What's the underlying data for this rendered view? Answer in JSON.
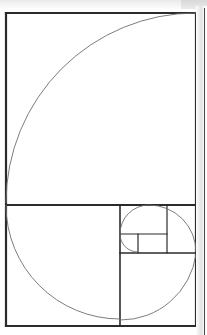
{
  "figure": {
    "background_color": "#ffffff",
    "line_color": "#2b2b2b",
    "spiral_color": "#6e6e6e",
    "page_edge_color": "#e2e2e2",
    "frame": {
      "x": 6,
      "y": 13,
      "width": 190,
      "height": 313
    },
    "stroke_widths": {
      "frame": 2.2,
      "divider": 2.0,
      "inner": 1.6,
      "small": 1.2,
      "spiral": 0.9
    }
  },
  "chart_data": {
    "type": "diagram",
    "ratio": 1.618,
    "aspect": "190 x 313 px outer rectangle",
    "squares": [
      {
        "index": 1,
        "fib": 8,
        "x": 6,
        "y": 13,
        "size": 190,
        "arc_center": [
          6,
          203
        ],
        "arc_from": [
          196,
          13
        ],
        "arc_to": [
          6,
          203
        ]
      },
      {
        "index": 2,
        "fib": 5,
        "x": 6,
        "y": 205,
        "size": 114,
        "arc_center": [
          120,
          205
        ],
        "arc_from": [
          6,
          205
        ],
        "arc_to": [
          120,
          319
        ]
      },
      {
        "index": 3,
        "fib": 3,
        "x": 120,
        "y": 254,
        "size": 76,
        "arc_center": [
          120,
          254
        ],
        "arc_from": [
          120,
          320
        ],
        "arc_to": [
          196,
          254
        ]
      },
      {
        "index": 4,
        "fib": 2,
        "x": 120,
        "y": 205,
        "size": 47,
        "arc_center": [
          167,
          252
        ],
        "arc_from": [
          196,
          252
        ],
        "arc_to": [
          120,
          205
        ]
      },
      {
        "index": 5,
        "fib": 1,
        "x": 120,
        "y": 234,
        "size": 29,
        "arc_center": [
          149,
          234
        ],
        "arc_from": [
          120,
          234
        ],
        "arc_to": [
          149,
          252
        ]
      },
      {
        "index": 6,
        "fib": 1,
        "x": 138,
        "y": 234,
        "size": 18,
        "arc_center": [
          138,
          234
        ],
        "arc_from": [
          138,
          252
        ],
        "arc_to": [
          167,
          234
        ]
      }
    ],
    "lines": [
      {
        "name": "outer-frame-top",
        "x1": 6,
        "y1": 13,
        "x2": 196,
        "y2": 13
      },
      {
        "name": "outer-frame-right",
        "x1": 196,
        "y1": 13,
        "x2": 196,
        "y2": 326
      },
      {
        "name": "outer-frame-bottom",
        "x1": 196,
        "y1": 326,
        "x2": 6,
        "y2": 326
      },
      {
        "name": "outer-frame-left",
        "x1": 6,
        "y1": 326,
        "x2": 6,
        "y2": 13
      },
      {
        "name": "major-horizontal-divider",
        "x1": 6,
        "y1": 205,
        "x2": 196,
        "y2": 205
      },
      {
        "name": "lower-vertical-divider",
        "x1": 120,
        "y1": 205,
        "x2": 120,
        "y2": 326
      },
      {
        "name": "mid-horizontal-divider",
        "x1": 120,
        "y1": 253,
        "x2": 196,
        "y2": 253
      },
      {
        "name": "small-vertical-divider",
        "x1": 167,
        "y1": 205,
        "x2": 167,
        "y2": 253
      },
      {
        "name": "tiny-horizontal-divider",
        "x1": 120,
        "y1": 234,
        "x2": 167,
        "y2": 234
      },
      {
        "name": "tiny-vertical-divider",
        "x1": 138,
        "y1": 234,
        "x2": 138,
        "y2": 253
      }
    ],
    "spiral_path": "M 196 13 A 190 190 0 0 0 6 203 M 6 205 A 114 114 0 0 0 120 319 M 120 320 A 76 76 0 0 0 196 254 M 196 252 A 47 47 0 0 0 149 205 M 149 205 A 29 29 0 0 0 120 234 M 120 234 A 18 18 0 0 0 138 252"
  }
}
